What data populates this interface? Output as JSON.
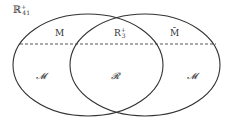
{
  "diagram": {
    "corner_label": {
      "base": "ℝ",
      "sup": "+",
      "sub": "41"
    },
    "upper_labels": {
      "left": "M",
      "middle": {
        "base": "R",
        "sup": "+",
        "sub": "3"
      },
      "right": "M̄"
    },
    "lower_labels": {
      "left": "𝓜",
      "middle": "𝓡",
      "right": "𝓜"
    },
    "ellipses": [
      {
        "name": "left",
        "cx": 88,
        "cy": 65,
        "rx": 75,
        "ry": 51
      },
      {
        "name": "right",
        "cx": 145,
        "cy": 65,
        "rx": 75,
        "ry": 51
      }
    ],
    "dashed_line_y": 44,
    "colors": {
      "stroke": "#333333",
      "background": "#ffffff"
    }
  }
}
